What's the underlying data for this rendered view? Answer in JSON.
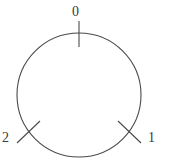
{
  "figure": {
    "title": "",
    "background_color": "#ffffff",
    "stroke_color": "#4a4a4a",
    "label_color": "#3a3a3a",
    "width": 170,
    "height": 163
  },
  "chart_data": {
    "type": "scatter",
    "title": "",
    "subtitle": "",
    "xlabel": "",
    "ylabel": "",
    "grid": false,
    "legend": null,
    "shape": {
      "name": "circle",
      "center_x": 79,
      "center_y": 95,
      "radius": 62,
      "stroke_width": 1.1
    },
    "categories": [
      "0",
      "1",
      "2"
    ],
    "values": [
      0,
      1,
      2
    ],
    "points": [
      {
        "label": "0",
        "index": 0,
        "angle_deg": 90,
        "tick_x1": 79,
        "tick_y1": 21,
        "tick_x2": 79,
        "tick_y2": 47,
        "label_x": 72,
        "label_y": 5
      },
      {
        "label": "1",
        "index": 1,
        "angle_deg": 315,
        "tick_x1": 118,
        "tick_y1": 121,
        "tick_x2": 141,
        "tick_y2": 143,
        "label_x": 148,
        "label_y": 131
      },
      {
        "label": "2",
        "index": 2,
        "angle_deg": 225,
        "tick_x1": 40,
        "tick_y1": 121,
        "tick_x2": 17,
        "tick_y2": 143,
        "label_x": 2,
        "label_y": 131
      }
    ],
    "axis_ranges": {
      "x": [
        0,
        170
      ],
      "y": [
        0,
        163
      ]
    }
  }
}
